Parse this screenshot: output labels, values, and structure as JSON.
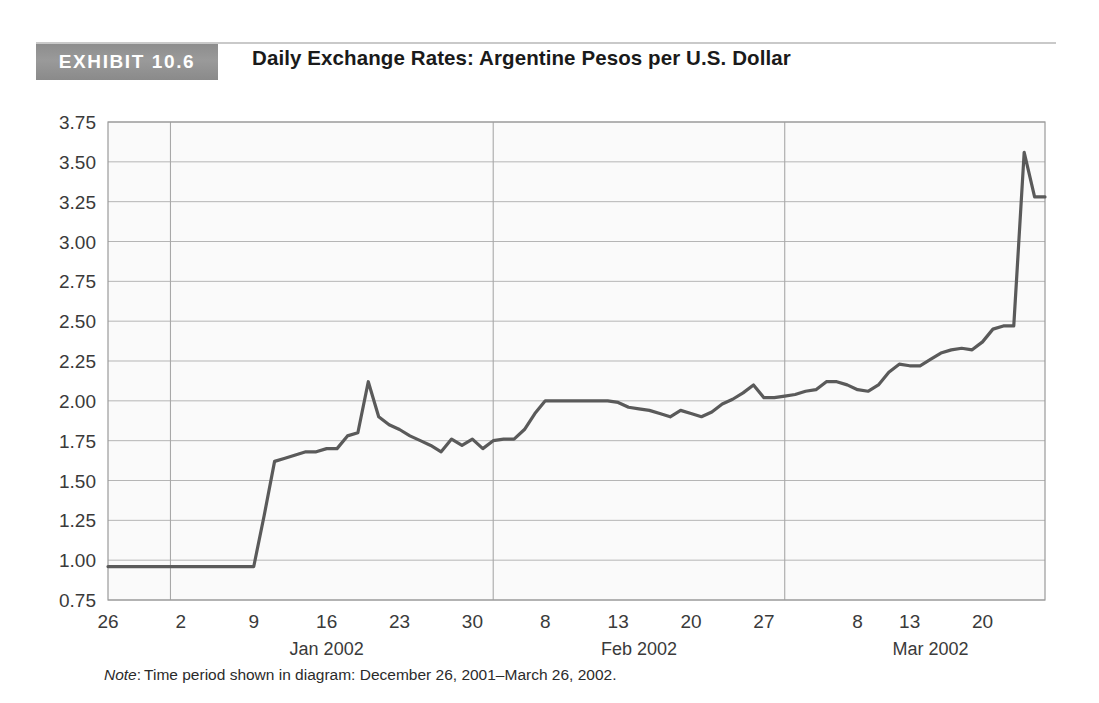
{
  "header": {
    "exhibit_tag": "EXHIBIT 10.6",
    "title": "Daily Exchange Rates: Argentine Pesos per U.S. Dollar"
  },
  "note": {
    "label": "Note",
    "separator": ":",
    "text": "Time period shown in diagram: December 26, 2001–March 26, 2002."
  },
  "colors": {
    "tag_background": "#8f8f8f",
    "tag_text": "#ffffff",
    "line": "#5a5a5a",
    "grid": "#b5b5b5",
    "plot_background": "#fafafa",
    "axis_text": "#3a3a3a",
    "rule": "#c9c9c9"
  },
  "chart_data": {
    "type": "line",
    "title": "Daily Exchange Rates: Argentine Pesos per U.S. Dollar",
    "xlabel": "",
    "ylabel": "",
    "ylim": [
      0.75,
      3.75
    ],
    "ytick_step": 0.25,
    "ytick_labels": [
      "3.75",
      "3.50",
      "3.25",
      "3.00",
      "2.75",
      "2.50",
      "2.25",
      "2.00",
      "1.75",
      "1.50",
      "1.25",
      "1.00",
      "0.75"
    ],
    "ytick_values": [
      3.75,
      3.5,
      3.25,
      3.0,
      2.75,
      2.5,
      2.25,
      2.0,
      1.75,
      1.5,
      1.25,
      1.0,
      0.75
    ],
    "grid": true,
    "legend": "none",
    "xtick_labels": [
      "26",
      "2",
      "9",
      "16",
      "23",
      "30",
      "8",
      "13",
      "20",
      "27",
      "8",
      "13",
      "20"
    ],
    "xtick_days": [
      0,
      7,
      14,
      21,
      28,
      35,
      42,
      49,
      56,
      63,
      72,
      77,
      84
    ],
    "month_labels": [
      "Jan 2002",
      "Feb 2002",
      "Mar 2002"
    ],
    "month_boundary_days": [
      6,
      37,
      65
    ],
    "x_range_days": [
      0,
      90
    ],
    "series": [
      {
        "name": "ARS per USD",
        "x": [
          0,
          1,
          2,
          3,
          4,
          5,
          6,
          7,
          8,
          9,
          10,
          11,
          12,
          13,
          14,
          15,
          16,
          17,
          18,
          19,
          20,
          21,
          22,
          23,
          24,
          25,
          26,
          27,
          28,
          29,
          30,
          31,
          32,
          33,
          34,
          35,
          36,
          37,
          38,
          39,
          40,
          41,
          42,
          43,
          44,
          45,
          46,
          47,
          48,
          49,
          50,
          51,
          52,
          53,
          54,
          55,
          56,
          57,
          58,
          59,
          60,
          61,
          62,
          63,
          64,
          65,
          66,
          67,
          68,
          69,
          70,
          71,
          72,
          73,
          74,
          75,
          76,
          77,
          78,
          79,
          80,
          81,
          82,
          83,
          84,
          85,
          86,
          87,
          88,
          89,
          90
        ],
        "values": [
          0.96,
          0.96,
          0.96,
          0.96,
          0.96,
          0.96,
          0.96,
          0.96,
          0.96,
          0.96,
          0.96,
          0.96,
          0.96,
          0.96,
          0.96,
          1.28,
          1.62,
          1.64,
          1.66,
          1.68,
          1.68,
          1.7,
          1.7,
          1.78,
          1.8,
          2.12,
          1.9,
          1.85,
          1.82,
          1.78,
          1.75,
          1.72,
          1.68,
          1.76,
          1.72,
          1.76,
          1.7,
          1.75,
          1.76,
          1.76,
          1.82,
          1.92,
          2.0,
          2.0,
          2.0,
          2.0,
          2.0,
          2.0,
          2.0,
          1.99,
          1.96,
          1.95,
          1.94,
          1.92,
          1.9,
          1.94,
          1.92,
          1.9,
          1.93,
          1.98,
          2.01,
          2.05,
          2.1,
          2.02,
          2.02,
          2.03,
          2.04,
          2.06,
          2.07,
          2.12,
          2.12,
          2.1,
          2.07,
          2.06,
          2.1,
          2.18,
          2.23,
          2.22,
          2.22,
          2.26,
          2.3,
          2.32,
          2.33,
          2.32,
          2.37,
          2.45,
          2.47,
          2.47,
          3.56,
          3.28,
          3.28
        ]
      }
    ],
    "annotations": {
      "start_value": 0.96,
      "peak_mid_january": 2.12,
      "plateau_february": 2.0,
      "peak_late_march": 3.56,
      "end_value": 3.28
    }
  }
}
